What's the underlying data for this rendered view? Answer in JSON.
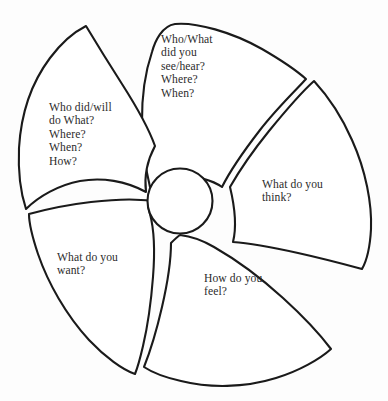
{
  "diagram": {
    "type": "pinwheel-segments",
    "segment_count": 5,
    "colors": {
      "background": "#fdfdfd",
      "petal_fill": "#ffffff",
      "stroke": "#1a1a1a",
      "text": "#2b2b2b"
    },
    "hub": {
      "label": "",
      "center_x": 180,
      "center_y": 201,
      "radius": 33
    },
    "segments": [
      {
        "id": "observation",
        "position": "top",
        "text": "Who/What\ndid you\nsee/hear?\nWhere?\nWhen?",
        "lines": [
          "Who/What",
          "did you",
          "see/hear?",
          "Where?",
          "When?"
        ]
      },
      {
        "id": "action",
        "position": "upper-left",
        "text": "Who did/will\ndo What?\nWhere?\nWhen?\nHow?",
        "lines": [
          "Who did/will",
          "do What?",
          "Where?",
          "When?",
          "How?"
        ]
      },
      {
        "id": "thought",
        "position": "right",
        "text": "What do you\nthink?",
        "lines": [
          "What do you",
          "think?"
        ]
      },
      {
        "id": "want",
        "position": "lower-left",
        "text": "What do you\nwant?",
        "lines": [
          "What do you",
          "want?"
        ]
      },
      {
        "id": "feeling",
        "position": "bottom",
        "text": "How do you\nfeel?",
        "lines": [
          "How do you",
          "feel?"
        ]
      }
    ]
  }
}
